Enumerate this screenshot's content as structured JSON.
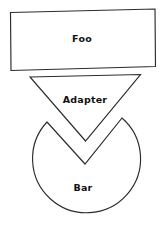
{
  "diagram": {
    "background_color": "#ffffff",
    "stroke_color": "#2b2b2b",
    "fill_color": "#ffffff",
    "text_color": "#111111",
    "shapes": [
      {
        "id": "foo",
        "kind": "rectangle",
        "label": "Foo",
        "label_x": 82,
        "label_y": 39,
        "points": "10.5,12.5 155,9 155.5,66.5 11,70.5"
      },
      {
        "id": "adapter",
        "kind": "triangle-down",
        "label": "Adapter",
        "label_x": 85,
        "label_y": 100,
        "points": "30,77 140.5,74.5 85.5,141"
      },
      {
        "id": "bar",
        "kind": "circle-with-v-notch",
        "label": "Bar",
        "label_x": 83,
        "label_y": 188,
        "notch_left_peak_x": 47,
        "notch_left_peak_y": 122,
        "notch_right_peak_x": 122,
        "notch_right_peak_y": 118,
        "notch_bottom_x": 85,
        "notch_bottom_y": 164,
        "circle_center_x": 84,
        "circle_center_y": 168,
        "circle_radius": 54,
        "path": "M 47,122 L 85,164 L 122,118 A 54,54 0 1 1 47,122 Z"
      }
    ]
  }
}
